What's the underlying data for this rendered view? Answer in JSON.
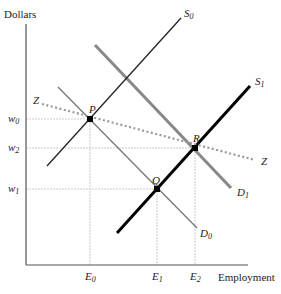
{
  "axes": {
    "y_label": "Dollars",
    "x_label": "Employment"
  },
  "y_ticks": [
    {
      "label": "w",
      "sub": "0",
      "y": 119
    },
    {
      "label": "w",
      "sub": "2",
      "y": 148
    },
    {
      "label": "w",
      "sub": "1",
      "y": 189
    }
  ],
  "x_ticks": [
    {
      "label": "E",
      "sub": "0",
      "x": 90
    },
    {
      "label": "E",
      "sub": "1",
      "x": 157
    },
    {
      "label": "E",
      "sub": "2",
      "x": 195
    }
  ],
  "curves": {
    "S0": {
      "label": "S",
      "sub": "0"
    },
    "S1": {
      "label": "S",
      "sub": "1"
    },
    "D0": {
      "label": "D",
      "sub": "0"
    },
    "D1": {
      "label": "D",
      "sub": "1"
    },
    "Z_left": {
      "label": "Z"
    },
    "Z_right": {
      "label": "Z"
    }
  },
  "points": {
    "P": {
      "label": "P"
    },
    "Q": {
      "label": "Q"
    },
    "R": {
      "label": "R"
    }
  },
  "colors": {
    "axis": "#555555",
    "guide": "#bbbbbb",
    "s0": "#222222",
    "d0": "#777777",
    "d1": "#888888",
    "s1": "#000000",
    "z": "#999999"
  }
}
